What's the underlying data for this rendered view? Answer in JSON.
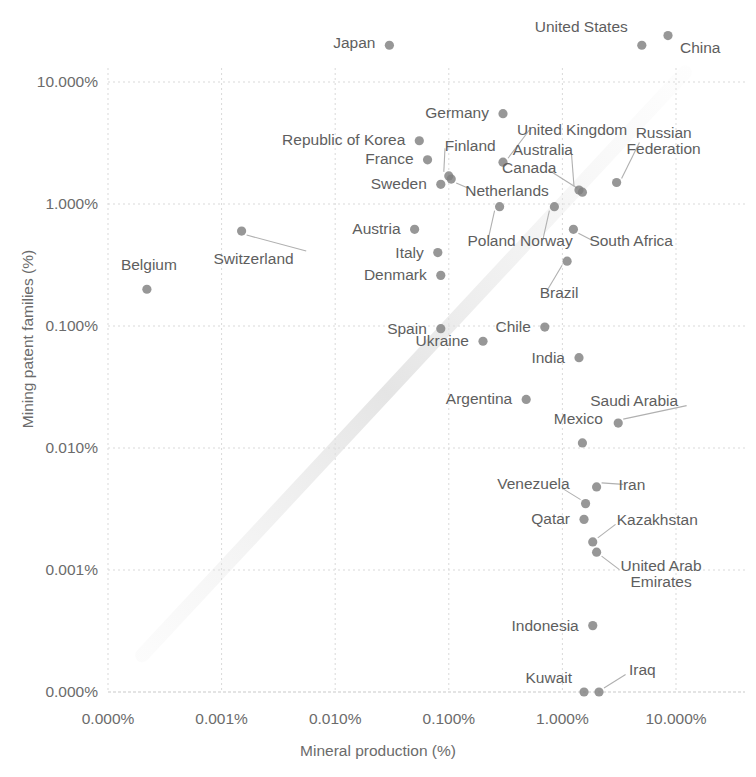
{
  "chart_data": {
    "type": "scatter",
    "title": "",
    "xlabel": "Mineral production (%)",
    "ylabel": "Mining patent families (%)",
    "x_scale": "log",
    "y_scale": "log",
    "grid": true,
    "legend": "none",
    "x_ticks": [
      "0.000%",
      "0.001%",
      "0.010%",
      "0.100%",
      "1.000%",
      "10.000%"
    ],
    "y_ticks": [
      "0.000%",
      "0.001%",
      "0.010%",
      "0.100%",
      "1.000%",
      "10.000%"
    ],
    "xlim": [
      0.0001,
      30
    ],
    "ylim": [
      0.0001,
      30
    ],
    "marker_color": "#808080",
    "grid_color": "#d9d9d9",
    "text_color": "#6b6b6b",
    "points": [
      {
        "label": "Japan",
        "x": 0.03,
        "y": 20.0,
        "label_pos": "right"
      },
      {
        "label": "United States",
        "x": 5.0,
        "y": 20.0,
        "label_pos": "left-up"
      },
      {
        "label": "China",
        "x": 8.5,
        "y": 24.0,
        "label_pos": "right-down"
      },
      {
        "label": "Germany",
        "x": 0.3,
        "y": 5.5,
        "label_pos": "right"
      },
      {
        "label": "Republic of Korea",
        "x": 0.055,
        "y": 3.3,
        "label_pos": "right"
      },
      {
        "label": "United Kingdom",
        "x": 0.3,
        "y": 2.2,
        "label_pos": "leader-up"
      },
      {
        "label": "Russian Federation",
        "x": 3.0,
        "y": 1.5,
        "label_pos": "leader-up"
      },
      {
        "label": "France",
        "x": 0.065,
        "y": 2.3,
        "label_pos": "right"
      },
      {
        "label": "Finland",
        "x": 0.1,
        "y": 1.7,
        "label_pos": "leader-up"
      },
      {
        "label": "Australia",
        "x": 1.4,
        "y": 1.3,
        "label_pos": "leader-up"
      },
      {
        "label": "Canada",
        "x": 1.5,
        "y": 1.25,
        "label_pos": "leader-up"
      },
      {
        "label": "Sweden",
        "x": 0.085,
        "y": 1.45,
        "label_pos": "right"
      },
      {
        "label": "Netherlands",
        "x": 0.105,
        "y": 1.6,
        "label_pos": "leader-right"
      },
      {
        "label": "Poland",
        "x": 0.28,
        "y": 0.95,
        "label_pos": "leader-down"
      },
      {
        "label": "Norway",
        "x": 0.85,
        "y": 0.95,
        "label_pos": "leader-down"
      },
      {
        "label": "South Africa",
        "x": 1.25,
        "y": 0.62,
        "label_pos": "leader-right"
      },
      {
        "label": "Austria",
        "x": 0.05,
        "y": 0.62,
        "label_pos": "right"
      },
      {
        "label": "Switzerland",
        "x": 0.0015,
        "y": 0.6,
        "label_pos": "leader-down"
      },
      {
        "label": "Italy",
        "x": 0.08,
        "y": 0.4,
        "label_pos": "right"
      },
      {
        "label": "Brazil",
        "x": 1.1,
        "y": 0.34,
        "label_pos": "leader-down"
      },
      {
        "label": "Denmark",
        "x": 0.085,
        "y": 0.26,
        "label_pos": "right"
      },
      {
        "label": "Belgium",
        "x": 0.00022,
        "y": 0.2,
        "label_pos": "up"
      },
      {
        "label": "Chile",
        "x": 0.7,
        "y": 0.098,
        "label_pos": "right"
      },
      {
        "label": "Spain",
        "x": 0.085,
        "y": 0.095,
        "label_pos": "right"
      },
      {
        "label": "Ukraine",
        "x": 0.2,
        "y": 0.075,
        "label_pos": "right"
      },
      {
        "label": "India",
        "x": 1.4,
        "y": 0.055,
        "label_pos": "right"
      },
      {
        "label": "Argentina",
        "x": 0.48,
        "y": 0.025,
        "label_pos": "right"
      },
      {
        "label": "Saudi Arabia",
        "x": 3.1,
        "y": 0.016,
        "label_pos": "leader-up"
      },
      {
        "label": "Mexico",
        "x": 1.5,
        "y": 0.011,
        "label_pos": "up"
      },
      {
        "label": "Iran",
        "x": 2.0,
        "y": 0.0048,
        "label_pos": "leader-right"
      },
      {
        "label": "Venezuela",
        "x": 1.6,
        "y": 0.0035,
        "label_pos": "leader-up"
      },
      {
        "label": "Qatar",
        "x": 1.55,
        "y": 0.0026,
        "label_pos": "right"
      },
      {
        "label": "Kazakhstan",
        "x": 1.85,
        "y": 0.0017,
        "label_pos": "leader-right"
      },
      {
        "label": "United Arab Emirates",
        "x": 2.0,
        "y": 0.0014,
        "label_pos": "leader-right"
      },
      {
        "label": "Indonesia",
        "x": 1.85,
        "y": 0.00035,
        "label_pos": "right"
      },
      {
        "label": "Kuwait",
        "x": 1.55,
        "y": 0.0001,
        "label_pos": "up"
      },
      {
        "label": "Iraq",
        "x": 2.1,
        "y": 0.0001,
        "label_pos": "leader-right"
      }
    ]
  },
  "axes": {
    "x_title": "Mineral production (%)",
    "y_title": "Mining patent families (%)",
    "x_tick_labels": [
      "0.000%",
      "0.001%",
      "0.010%",
      "0.100%",
      "1.000%",
      "10.000%"
    ],
    "y_tick_labels": [
      "0.000%",
      "0.001%",
      "0.010%",
      "0.100%",
      "1.000%",
      "10.000%"
    ]
  },
  "labels": {
    "japan": "Japan",
    "united_states": "United States",
    "china": "China",
    "germany": "Germany",
    "republic_of_korea": "Republic of Korea",
    "united_kingdom": "United Kingdom",
    "russian_federation": "Russian\nFederation",
    "russian_federation_l1": "Russian",
    "russian_federation_l2": "Federation",
    "france": "France",
    "finland": "Finland",
    "australia": "Australia",
    "canada": "Canada",
    "sweden": "Sweden",
    "netherlands": "Netherlands",
    "poland": "Poland",
    "norway": "Norway",
    "south_africa": "South Africa",
    "austria": "Austria",
    "switzerland": "Switzerland",
    "italy": "Italy",
    "brazil": "Brazil",
    "denmark": "Denmark",
    "belgium": "Belgium",
    "chile": "Chile",
    "spain": "Spain",
    "ukraine": "Ukraine",
    "india": "India",
    "argentina": "Argentina",
    "saudi_arabia": "Saudi Arabia",
    "mexico": "Mexico",
    "iran": "Iran",
    "venezuela": "Venezuela",
    "qatar": "Qatar",
    "kazakhstan": "Kazakhstan",
    "uae_l1": "United Arab",
    "uae_l2": "Emirates",
    "indonesia": "Indonesia",
    "kuwait": "Kuwait",
    "iraq": "Iraq"
  }
}
